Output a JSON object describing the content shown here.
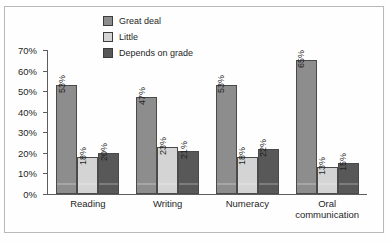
{
  "chart_data": {
    "type": "bar",
    "title": "",
    "xlabel": "",
    "ylabel": "",
    "categories": [
      "Reading",
      "Writing",
      "Numeracy",
      "Oral communication"
    ],
    "series": [
      {
        "name": "Great deal",
        "color": "#8d8d8d",
        "values": [
          53,
          47,
          53,
          65
        ]
      },
      {
        "name": "Little",
        "color": "#d4d4d4",
        "values": [
          18,
          23,
          18,
          13
        ]
      },
      {
        "name": "Depends on grade",
        "color": "#585858",
        "values": [
          20,
          21,
          22,
          15
        ]
      }
    ],
    "value_labels": [
      [
        "53%",
        "18%",
        "20%"
      ],
      [
        "47%",
        "23%",
        "21%"
      ],
      [
        "53%",
        "18%",
        "22%"
      ],
      [
        "65%",
        "13%",
        "15%"
      ]
    ],
    "ylim": [
      0,
      70
    ],
    "ytick_values": [
      70,
      60,
      50,
      40,
      30,
      20,
      10,
      0
    ],
    "ytick_labels": [
      "70%",
      "60%",
      "50%",
      "40%",
      "30%",
      "20%",
      "10%",
      "0%"
    ],
    "grid": false,
    "legend_position": "top-left"
  },
  "legend": {
    "items": [
      {
        "label": "Great deal"
      },
      {
        "label": "Little"
      },
      {
        "label": "Depends on grade"
      }
    ]
  },
  "categories_display": [
    {
      "line1": "Reading",
      "line2": ""
    },
    {
      "line1": "Writing",
      "line2": ""
    },
    {
      "line1": "Numeracy",
      "line2": ""
    },
    {
      "line1": "Oral",
      "line2": "communication"
    }
  ]
}
